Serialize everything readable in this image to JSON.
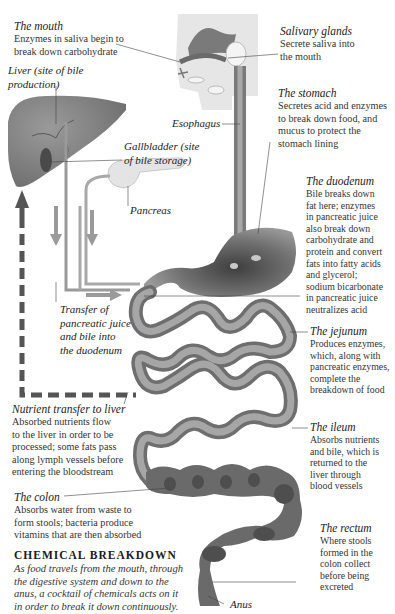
{
  "diagram": {
    "colors": {
      "organ_gray": "#8a8a8a",
      "organ_dark": "#5a5a5a",
      "arrow_gray": "#9a9a9a",
      "dashed_arrow": "#555555",
      "head_bg": "#e6e6e6",
      "pancreas": "#e4e4e4"
    },
    "labels": {
      "mouth": {
        "title": "The mouth",
        "desc": "Enzymes in saliva begin to\nbreak down carbohydrate"
      },
      "liver": {
        "title": "Liver (site of bile\nproduction)"
      },
      "salivary": {
        "title": "Salivary glands",
        "desc": "Secrete saliva into\nthe mouth"
      },
      "esophagus": {
        "title": "Esophagus"
      },
      "stomach": {
        "title": "The stomach",
        "desc": "Secretes acid and enzymes\nto break down food, and\nmucus to protect the\nstomach lining"
      },
      "gallbladder": {
        "title": "Gallbladder (site\nof bile storage)"
      },
      "pancreas": {
        "title": "Pancreas"
      },
      "duodenum": {
        "title": "The duodenum",
        "desc": "Bile breaks down\nfat here; enzymes\nin pancreatic juice\nalso break down\ncarbohydrate and\nprotein and convert\nfats into fatty acids\nand glycerol;\nsodium bicarbonate\nin pancreatic juice\nneutralizes acid"
      },
      "transfer": {
        "title": "Transfer of\npancreatic juice\nand bile into\nthe duodenum"
      },
      "jejunum": {
        "title": "The jejunum",
        "desc": "Produces enzymes,\nwhich, along with\npancreatic enzymes,\ncomplete the\nbreakdown of food"
      },
      "nutrient": {
        "title": "Nutrient transfer to liver",
        "desc": "Absorbed nutrients flow\nto the liver in order to be\nprocessed; some fats pass\nalong lymph vessels before\nentering the bloodstream"
      },
      "ileum": {
        "title": "The ileum",
        "desc": "Absorbs nutrients\nand bile, which is\nreturned to the\nliver through\nblood vessels"
      },
      "colon": {
        "title": "The colon",
        "desc": "Absorbs water from waste to\nform stools; bacteria produce\nvitamins that are then absorbed"
      },
      "rectum": {
        "title": "The rectum",
        "desc": "Where stools\nformed in the\ncolon collect\nbefore being\nexcreted"
      },
      "anus": {
        "title": "Anus"
      }
    },
    "section": {
      "heading": "CHEMICAL BREAKDOWN",
      "intro": "As food travels from the mouth, through\nthe digestive system and down to the\nanus, a cocktail of chemicals acts on it\nin order to break it down continuously."
    }
  }
}
